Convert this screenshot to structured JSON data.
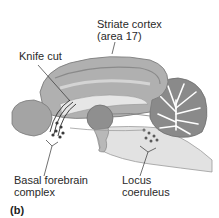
{
  "figure": {
    "panel_label": "(b)",
    "labels": {
      "striate_cortex_line1": "Striate cortex",
      "striate_cortex_line2": "(area 17)",
      "knife_cut": "Knife cut",
      "basal_forebrain_line1": "Basal forebrain",
      "basal_forebrain_line2": "complex",
      "locus_coeruleus_line1": "Locus",
      "locus_coeruleus_line2": "coeruleus"
    }
  },
  "colors": {
    "cortex": "#a9a9a9",
    "cortex_light": "#cfcfcf",
    "interior": "#e4e4e4",
    "thalamus": "#8f8f8f",
    "cerebellum": "#8a8a8a",
    "nuclei_dots": "#3a3a3a",
    "leader_lines": "#333333"
  }
}
